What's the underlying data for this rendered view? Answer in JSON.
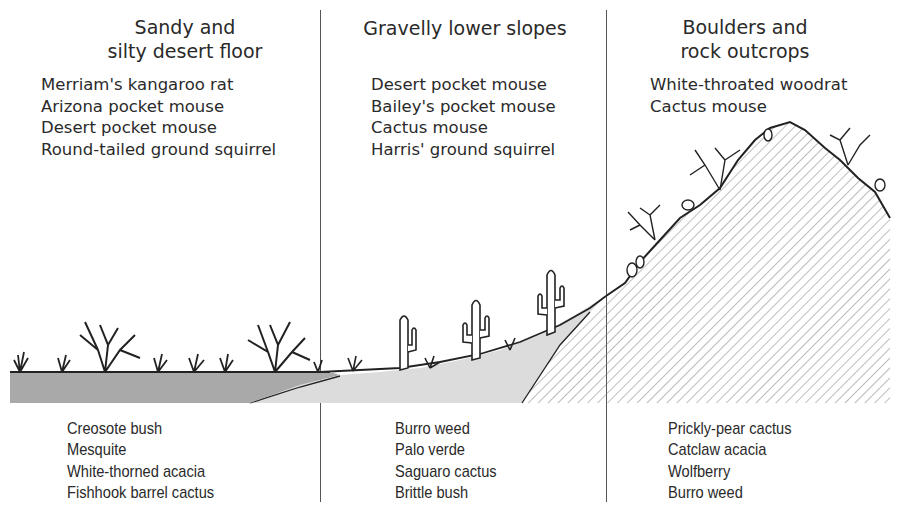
{
  "zones": [
    {
      "title_line1": "Sandy and",
      "title_line2": "silty desert floor",
      "animals": [
        "Merriam's kangaroo rat",
        "Arizona pocket mouse",
        "Desert pocket mouse",
        "Round-tailed ground squirrel"
      ],
      "plants": [
        "Creosote bush",
        "Mesquite",
        "White-thorned acacia",
        "Fishhook barrel cactus"
      ]
    },
    {
      "title_line1": "Gravelly lower slopes",
      "title_line2": "",
      "animals": [
        "Desert pocket mouse",
        "Bailey's pocket mouse",
        "Cactus mouse",
        "Harris' ground squirrel"
      ],
      "plants": [
        "Burro weed",
        "Palo verde",
        "Saguaro cactus",
        "Brittle bush"
      ]
    },
    {
      "title_line1": "Boulders and",
      "title_line2": "rock outcrops",
      "animals": [
        "White-throated woodrat",
        "Cactus mouse"
      ],
      "plants": [
        "Prickly-pear cactus",
        "Catclaw acacia",
        "Wolfberry",
        "Burro weed"
      ]
    }
  ],
  "colors": {
    "desert_floor_fill": "#a9a9a9",
    "gravel_fill": "#dcdcdc",
    "rock_hatch": "#7a7a7a",
    "ink": "#2a2a2a"
  }
}
